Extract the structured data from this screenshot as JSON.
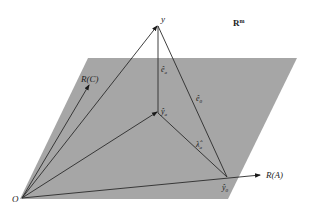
{
  "diagram": {
    "space_label": "R",
    "space_superscript": "m",
    "labels": {
      "y": "y",
      "e_a": "ê",
      "e_a_sub": "a",
      "e_0": "ê",
      "e_0_sub": "0",
      "y_a": "ŷ",
      "y_a_sub": "a",
      "lambda_a": "λ̂",
      "lambda_a_sub": "a",
      "y_0": "ŷ",
      "y_0_sub": "0",
      "RC": "R(C)",
      "RA": "R(A)",
      "O": "O"
    },
    "colors": {
      "plane": "#a6a6a6",
      "lines": "#2a2a2a",
      "background": "#ffffff"
    }
  }
}
